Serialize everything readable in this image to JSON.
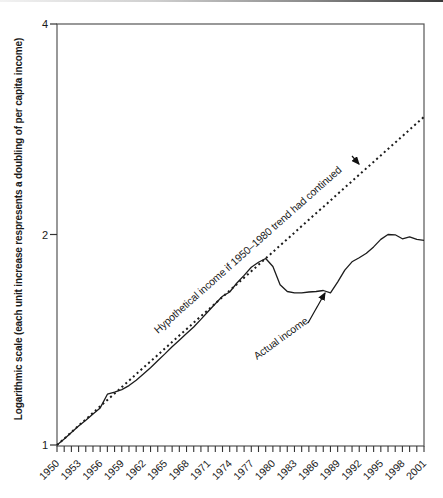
{
  "page": {
    "background": "#ffffff"
  },
  "chart_data": {
    "type": "line",
    "title": "",
    "xlabel": "",
    "ylabel": "Logarithmic scale (each unit increase respresents a doubling of per capita income)",
    "y_scale": "logarithmic (base 2)",
    "ylim": [
      1,
      4
    ],
    "xlim": [
      1950,
      2001
    ],
    "y_ticks": [
      1,
      2,
      4
    ],
    "x_tick_labels": [
      1950,
      1953,
      1956,
      1959,
      1962,
      1965,
      1968,
      1971,
      1974,
      1977,
      1980,
      1983,
      1986,
      1989,
      1992,
      1995,
      1998,
      2001
    ],
    "x_minor_tick_interval_years": 1,
    "grid": false,
    "legend_position": "inline-annotations",
    "frame_color": "#555555",
    "tick_color": "#333333",
    "line_color": "#1c1c1c",
    "text_color": "#1a1a1a",
    "x": [
      1950,
      1951,
      1952,
      1953,
      1954,
      1955,
      1956,
      1957,
      1958,
      1959,
      1960,
      1961,
      1962,
      1963,
      1964,
      1965,
      1966,
      1967,
      1968,
      1969,
      1970,
      1971,
      1972,
      1973,
      1974,
      1975,
      1976,
      1977,
      1978,
      1979,
      1980,
      1981,
      1982,
      1983,
      1984,
      1985,
      1986,
      1987,
      1988,
      1989,
      1990,
      1991,
      1992,
      1993,
      1994,
      1995,
      1996,
      1997,
      1998,
      1999,
      2000,
      2001
    ],
    "series": [
      {
        "id": "hypothetical-income-line",
        "name": "Hypothetical income if 1950–1980 trend had continued",
        "style": "dotted",
        "color": "#1c1c1c",
        "values": [
          1.0,
          1.021,
          1.043,
          1.066,
          1.088,
          1.112,
          1.136,
          1.16,
          1.185,
          1.21,
          1.236,
          1.263,
          1.29,
          1.317,
          1.345,
          1.374,
          1.404,
          1.434,
          1.464,
          1.496,
          1.528,
          1.56,
          1.594,
          1.628,
          1.663,
          1.698,
          1.735,
          1.772,
          1.81,
          1.849,
          1.888,
          1.929,
          1.97,
          2.012,
          2.056,
          2.1,
          2.145,
          2.19,
          2.237,
          2.285,
          2.334,
          2.384,
          2.435,
          2.487,
          2.54,
          2.595,
          2.65,
          2.707,
          2.765,
          2.824,
          2.885,
          2.946
        ]
      },
      {
        "id": "actual-income-line",
        "name": "Actual income",
        "style": "solid",
        "color": "#1c1c1c",
        "values": [
          1.0,
          1.02,
          1.042,
          1.065,
          1.085,
          1.108,
          1.13,
          1.182,
          1.19,
          1.2,
          1.216,
          1.238,
          1.263,
          1.29,
          1.32,
          1.35,
          1.382,
          1.412,
          1.443,
          1.475,
          1.512,
          1.552,
          1.592,
          1.632,
          1.655,
          1.705,
          1.748,
          1.795,
          1.825,
          1.848,
          1.8,
          1.695,
          1.658,
          1.65,
          1.65,
          1.655,
          1.658,
          1.663,
          1.65,
          1.71,
          1.778,
          1.828,
          1.852,
          1.88,
          1.92,
          1.968,
          2.0,
          1.998,
          1.972,
          1.985,
          1.968,
          1.962
        ]
      }
    ],
    "annotations": [
      {
        "id": "hypothetical-income-annotation",
        "text": "Hypothetical income if 1950–1980 trend had continued",
        "x": 158,
        "y": 334,
        "rotation": -41.5,
        "arrow": {
          "x1": 352,
          "y1": 156,
          "x2": 359,
          "y2": 164
        }
      },
      {
        "id": "actual-income-annotation",
        "text": "Actual income",
        "x": 257,
        "y": 360,
        "rotation": -36,
        "arrow": {
          "x1": 308,
          "y1": 323,
          "x2": 325,
          "y2": 293
        }
      }
    ]
  }
}
